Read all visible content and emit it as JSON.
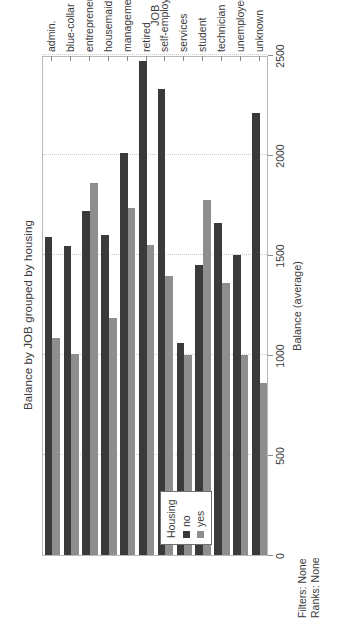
{
  "chart_data": {
    "type": "bar",
    "orientation": "horizontal",
    "title": "Balance by JOB grouped by housing",
    "xlabel": "JOB",
    "ylabel": "Balance (average)",
    "categories": [
      "admin.",
      "blue-collar",
      "entrepreneur",
      "housemaid",
      "management",
      "retired",
      "self-employed",
      "services",
      "student",
      "technician",
      "unemployed",
      "unknown"
    ],
    "legend_title": "Housing",
    "legend_position": "inside-left",
    "grid": true,
    "ylim": [
      0,
      2500
    ],
    "ticks": [
      "0",
      "500",
      "1000",
      "1500",
      "2000",
      "2500"
    ],
    "tick_values": [
      0,
      500,
      1000,
      1500,
      2000,
      2500
    ],
    "series": [
      {
        "name": "no",
        "color": "#3a3a3a",
        "values": [
          1590,
          1545,
          1720,
          1600,
          2010,
          2470,
          2330,
          1060,
          1450,
          1660,
          1500,
          2210
        ]
      },
      {
        "name": "yes",
        "color": "#8e8e8e",
        "values": [
          1085,
          1005,
          1860,
          1185,
          1735,
          1550,
          1395,
          1000,
          1775,
          1360,
          1000,
          860
        ]
      }
    ]
  },
  "footer": {
    "filters": "Filters: None",
    "ranks": "Ranks: None"
  }
}
